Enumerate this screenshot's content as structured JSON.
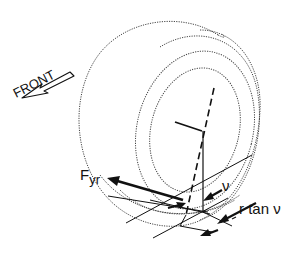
{
  "diagram": {
    "labels": {
      "front": "FRONT",
      "force_main": "F",
      "force_sub": "yr",
      "angle": "ν",
      "offset": "r tan ν"
    },
    "colors": {
      "ink": "#111111",
      "outline": "#444444",
      "background": "#ffffff"
    }
  }
}
